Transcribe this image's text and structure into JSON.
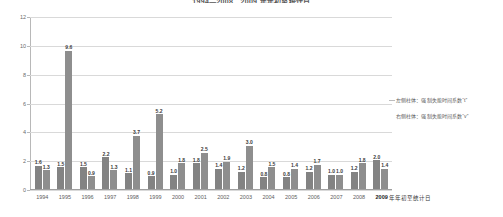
{
  "chart": {
    "title": "1994—2008、2009 年年初至统计日",
    "xlabel_suffix": "年年初至统计日"
  },
  "legend": {
    "items": [
      "左侧柱体：强制失能时间系数“t”",
      "右侧柱体：强制失能时间系数“v”"
    ]
  },
  "chart_data": {
    "type": "bar",
    "title": "1994—2008、2009 年年初至统计日",
    "xlabel": "",
    "ylabel": "",
    "ylim": [
      0,
      12
    ],
    "yticks": [
      0,
      2,
      4,
      6,
      8,
      10,
      12
    ],
    "ytick_labels": [
      "0",
      "2",
      "4",
      "6",
      "8",
      "10",
      "12"
    ],
    "grid": true,
    "legend_position": "right",
    "categories": [
      "1994",
      "1995",
      "1996",
      "1997",
      "1998",
      "1999",
      "2000",
      "2001",
      "2002",
      "2003",
      "2004",
      "2005",
      "2006",
      "2007",
      "2008",
      "2009"
    ],
    "series": [
      {
        "name": "左侧柱体：强制失能时间系数“t”",
        "color": "#838383",
        "values": [
          1.6,
          1.5,
          1.5,
          2.2,
          1.1,
          0.9,
          1.0,
          1.8,
          1.4,
          1.2,
          0.8,
          0.8,
          1.2,
          1.0,
          1.2,
          2.0
        ],
        "labels": [
          "1.6",
          "1.5",
          "1.5",
          "2.2",
          "1.1",
          "0.9",
          "1.0",
          "1.8",
          "1.4",
          "1.2",
          "0.8",
          "0.8",
          "1.2",
          "1.0",
          "1.2",
          "2.0"
        ]
      },
      {
        "name": "右侧柱体：强制失能时间系数“v”",
        "color": "#8e8e8e",
        "values": [
          1.3,
          9.6,
          0.9,
          1.3,
          3.7,
          5.2,
          1.8,
          2.5,
          1.9,
          3.0,
          1.5,
          1.4,
          1.7,
          1.0,
          1.8,
          1.4
        ],
        "labels": [
          "1.3",
          "9.6",
          "0.9",
          "1.3",
          "3.7",
          "5.2",
          "1.8",
          "2.5",
          "1.9",
          "3.0",
          "1.5",
          "1.4",
          "1.7",
          "1.0",
          "1.8",
          "1.4"
        ]
      }
    ]
  }
}
